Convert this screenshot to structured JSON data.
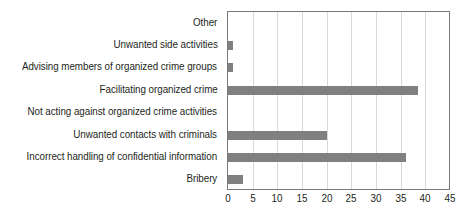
{
  "chart_data": {
    "type": "bar",
    "orientation": "horizontal",
    "title": "",
    "subtitle": "",
    "xlabel": "",
    "ylabel": "",
    "categories": [
      "Other",
      "Unwanted side activities",
      "Advising members of organized crime groups",
      "Facilitating organized crime",
      "Not acting against organized crime activities",
      "Unwanted contacts with criminals",
      "Incorrect handling of confidential information",
      "Bribery"
    ],
    "values": [
      0,
      1,
      1,
      38.5,
      0,
      20,
      36,
      3
    ],
    "xlim": [
      0,
      45
    ],
    "xticks": [
      0,
      5,
      10,
      15,
      20,
      25,
      30,
      35,
      40,
      45
    ],
    "xtick_labels": [
      "0",
      "5",
      "10",
      "15",
      "20",
      "25",
      "30",
      "35",
      "40",
      "45"
    ],
    "grid": "vertical",
    "legend": "none",
    "bar_color": "#808080",
    "grid_color": "#d9d9d9",
    "axis_color": "#7a7a7a",
    "text_color": "#231f20",
    "background": "#ffffff"
  }
}
